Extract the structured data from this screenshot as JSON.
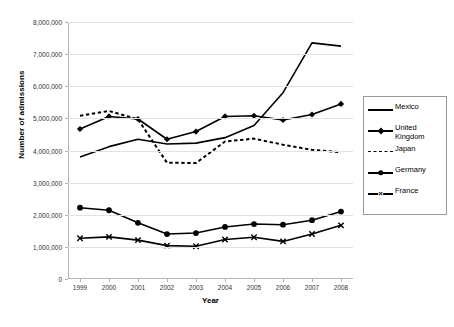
{
  "chart_data": {
    "type": "line",
    "title": "",
    "xlabel": "Year",
    "ylabel": "Number of admissions",
    "categories": [
      "1999",
      "2000",
      "2001",
      "2002",
      "2003",
      "2004",
      "2005",
      "2006",
      "2007",
      "2008"
    ],
    "x": [
      1999,
      2000,
      2001,
      2002,
      2003,
      2004,
      2005,
      2006,
      2007,
      2008
    ],
    "ylim": [
      0,
      8000000
    ],
    "ytick_values": [
      0,
      1000000,
      2000000,
      3000000,
      4000000,
      5000000,
      6000000,
      7000000,
      8000000
    ],
    "ytick_labels": [
      "0",
      "1,000,000",
      "2,000,000",
      "3,000,000",
      "4,000,000",
      "5,000,000",
      "6,000,000",
      "7,000,000",
      "8,000,000"
    ],
    "grid": true,
    "legend_position": "right",
    "series": [
      {
        "name": "Mexico",
        "style": "solid",
        "marker": "none",
        "color": "#000000",
        "values": [
          3800000,
          4120000,
          4350000,
          4200000,
          4230000,
          4400000,
          4780000,
          5800000,
          7350000,
          7250000
        ]
      },
      {
        "name": "United Kingdom",
        "style": "solid",
        "marker": "diamond",
        "color": "#000000",
        "values": [
          4670000,
          5060000,
          4980000,
          4350000,
          4590000,
          5060000,
          5080000,
          4950000,
          5120000,
          5450000
        ]
      },
      {
        "name": "Japan",
        "style": "dashed",
        "marker": "none",
        "color": "#000000",
        "values": [
          5080000,
          5230000,
          4970000,
          3620000,
          3610000,
          4280000,
          4370000,
          4180000,
          4020000,
          3950000
        ]
      },
      {
        "name": "Germany",
        "style": "solid",
        "marker": "circle",
        "color": "#000000",
        "values": [
          2220000,
          2140000,
          1750000,
          1400000,
          1430000,
          1620000,
          1710000,
          1690000,
          1830000,
          2100000
        ]
      },
      {
        "name": "France",
        "style": "solid",
        "marker": "x",
        "color": "#000000",
        "values": [
          1270000,
          1310000,
          1210000,
          1040000,
          1020000,
          1230000,
          1300000,
          1170000,
          1400000,
          1670000
        ]
      }
    ]
  },
  "legend": {
    "entries": [
      {
        "label": "Mexico"
      },
      {
        "label": "United Kingdom"
      },
      {
        "label": "Japan"
      },
      {
        "label": "Germany"
      },
      {
        "label": "France"
      }
    ]
  }
}
